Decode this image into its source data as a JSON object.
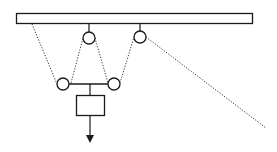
{
  "diagram": {
    "title": "",
    "type": "pulley-system",
    "colors": {
      "stroke": "#1a1a1a",
      "rope": "#333333",
      "background": "#ffffff"
    },
    "ceiling": {
      "x": 16,
      "y": 13,
      "width": 237,
      "height": 11
    },
    "pulleys": [
      {
        "id": "upper-left",
        "cx": 89,
        "cy": 38,
        "r": 6
      },
      {
        "id": "upper-right",
        "cx": 140,
        "cy": 37,
        "r": 6
      },
      {
        "id": "lower-left",
        "cx": 63,
        "cy": 84,
        "r": 6
      },
      {
        "id": "lower-right",
        "cx": 114,
        "cy": 84,
        "r": 6
      }
    ],
    "load": {
      "x": 76,
      "y": 95,
      "width": 28,
      "height": 21
    },
    "force_arrow": {
      "direction": "down"
    }
  }
}
